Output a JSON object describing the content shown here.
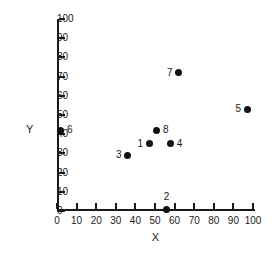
{
  "chart_data": {
    "type": "scatter",
    "title": "",
    "xlabel": "X",
    "ylabel": "Y",
    "xlim": [
      0,
      100
    ],
    "ylim": [
      0,
      100
    ],
    "grid": false,
    "legend": "none",
    "xticks": [
      "0",
      "10",
      "20",
      "30",
      "40",
      "50",
      "60",
      "70",
      "80",
      "90",
      "100"
    ],
    "yticks": [
      "0",
      "10",
      "20",
      "30",
      "40",
      "50",
      "60",
      "70",
      "80",
      "90",
      "100"
    ],
    "xtick_values": [
      0,
      10,
      20,
      30,
      40,
      50,
      60,
      70,
      80,
      90,
      100
    ],
    "ytick_values": [
      0,
      10,
      20,
      30,
      40,
      50,
      60,
      70,
      80,
      90,
      100
    ],
    "points": [
      {
        "label": "1",
        "x": 47,
        "y": 35,
        "label_pos": "left"
      },
      {
        "label": "2",
        "x": 56,
        "y": 1,
        "label_pos": "above"
      },
      {
        "label": "3",
        "x": 36,
        "y": 29,
        "label_pos": "left"
      },
      {
        "label": "4",
        "x": 58,
        "y": 35,
        "label_pos": "right"
      },
      {
        "label": "5",
        "x": 97,
        "y": 53,
        "label_pos": "left"
      },
      {
        "label": "6",
        "x": 2,
        "y": 42,
        "label_pos": "right"
      },
      {
        "label": "7",
        "x": 62,
        "y": 72,
        "label_pos": "left"
      },
      {
        "label": "8",
        "x": 51,
        "y": 42,
        "label_pos": "right"
      }
    ],
    "colors": {
      "marker": "#111111",
      "axis": "#1a1a1a",
      "background": "#ffffff",
      "text": "#1a1a1a"
    }
  }
}
